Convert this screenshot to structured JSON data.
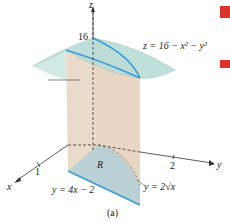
{
  "figure": {
    "caption": "(a)",
    "axes": {
      "x": "x",
      "y": "y",
      "z": "z"
    },
    "ticks": {
      "z": "16",
      "x": "1",
      "y": "2"
    },
    "labels": {
      "surface": "z = 16 − x² − y²",
      "region": "R",
      "line": "y = 4x − 2",
      "curve": "y = 2√x"
    },
    "colors": {
      "surface": "#b9dcd6",
      "wall": "#ecd9c6",
      "region": "#b5cfd6",
      "curve": "#3a9bd5",
      "axis": "#333333",
      "accent": "#d9332c"
    }
  }
}
